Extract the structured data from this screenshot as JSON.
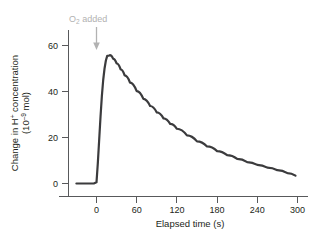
{
  "figure": {
    "background_color": "#ffffff",
    "curve_color": "#3b3b3d",
    "axis_color": "#58595b",
    "annotation_color": "#b2b2b2"
  },
  "axes": {
    "y_title_line1_a": "Change in H",
    "y_title_line1_sup": "+",
    "y_title_line1_b": " concentration",
    "y_title_line2_a": "(10",
    "y_title_line2_sup": "–9",
    "y_title_line2_b": " mol)",
    "x_title": "Elapsed time (s)",
    "y_ticks": [
      "0",
      "20",
      "40",
      "60"
    ],
    "x_ticks": [
      "0",
      "60",
      "120",
      "180",
      "240",
      "300"
    ]
  },
  "annotation": {
    "label_a": "O",
    "label_sub": "2",
    "label_b": " added",
    "arrow_at_x": 0
  },
  "chart_data": {
    "type": "line",
    "title": "",
    "xlabel": "Elapsed time (s)",
    "ylabel": "Change in H+ concentration (10^-9 mol)",
    "xlim": [
      -30,
      300
    ],
    "ylim": [
      -4,
      68
    ],
    "xticks": [
      0,
      60,
      120,
      180,
      240,
      300
    ],
    "yticks": [
      0,
      20,
      40,
      60
    ],
    "grid": false,
    "legend": null,
    "annotations": [
      {
        "text": "O2 added",
        "x": 0,
        "y": 66,
        "arrow_to_y": 58
      }
    ],
    "series": [
      {
        "name": "Change in H+ concentration",
        "x": [
          -30,
          -20,
          -10,
          -4,
          0,
          2,
          4,
          6,
          8,
          10,
          12,
          14,
          16,
          20,
          25,
          30,
          36,
          42,
          50,
          60,
          70,
          80,
          90,
          100,
          110,
          120,
          135,
          150,
          165,
          180,
          195,
          210,
          225,
          240,
          255,
          270,
          285,
          297
        ],
        "y": [
          0,
          0,
          0,
          0,
          0.5,
          9,
          19,
          29,
          38,
          45,
          50,
          53.5,
          55.5,
          55.8,
          54.2,
          52.2,
          49.6,
          47.0,
          43.9,
          40.2,
          36.8,
          33.7,
          30.9,
          28.3,
          25.9,
          23.8,
          20.9,
          18.3,
          16.1,
          14.1,
          12.3,
          10.7,
          9.3,
          8.1,
          6.9,
          5.8,
          4.5,
          3.4
        ]
      }
    ]
  }
}
